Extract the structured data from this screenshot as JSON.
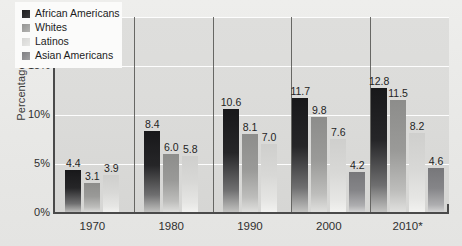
{
  "chart_data": {
    "type": "bar",
    "title": "",
    "xlabel": "",
    "ylabel": "Percentage",
    "ylim": [
      0,
      20
    ],
    "ytick_labels": [
      "0%",
      "5%",
      "10%",
      "15%",
      "20%"
    ],
    "ytick_values": [
      0,
      5,
      10,
      15,
      20
    ],
    "grid": true,
    "legend_position": "top-left",
    "categories": [
      "1970",
      "1980",
      "1990",
      "2000",
      "2010*"
    ],
    "series": [
      {
        "name": "African Americans",
        "color": "#222224",
        "values": [
          4.4,
          8.4,
          10.6,
          11.7,
          12.8
        ]
      },
      {
        "name": "Whites",
        "color": "#9a9a98",
        "values": [
          3.1,
          6.0,
          8.1,
          9.8,
          11.5
        ]
      },
      {
        "name": "Latinos",
        "color": "#d8d8d6",
        "values": [
          3.9,
          5.8,
          7.0,
          7.6,
          8.2
        ]
      },
      {
        "name": "Asian Americans",
        "color": "#858588",
        "values": [
          null,
          null,
          null,
          4.2,
          4.6
        ]
      }
    ],
    "bar_labels": {
      "1970": [
        "4.4",
        "3.1",
        "3.9"
      ],
      "1980": [
        "8.4",
        "6.0",
        "5.8"
      ],
      "1990": [
        "10.6",
        "8.1",
        "7.0"
      ],
      "2000": [
        "11.7",
        "9.8",
        "7.6",
        "4.2"
      ],
      "2010*": [
        "12.8",
        "11.5",
        "8.2",
        "4.6"
      ]
    }
  },
  "legend": {
    "items": [
      {
        "label": "African Americans"
      },
      {
        "label": "Whites"
      },
      {
        "label": "Latinos"
      },
      {
        "label": "Asian Americans"
      }
    ]
  }
}
